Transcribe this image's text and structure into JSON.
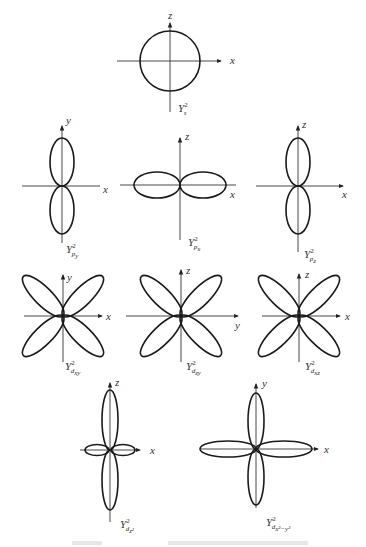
{
  "diagram": {
    "type": "angular-distribution-plots",
    "panels": [
      {
        "id": "s",
        "label_main": "Y",
        "label_sup": "2",
        "label_sub": "s",
        "axes": {
          "horizontal": "x",
          "vertical": "z"
        },
        "shape": "circle"
      },
      {
        "id": "py",
        "label_main": "Y",
        "label_sup": "2",
        "label_sub": "p",
        "label_subsub": "y",
        "axes": {
          "horizontal": "x",
          "vertical": "y"
        },
        "shape": "two-lobes-vertical"
      },
      {
        "id": "px",
        "label_main": "Y",
        "label_sup": "2",
        "label_sub": "p",
        "label_subsub": "x",
        "axes": {
          "horizontal": "x",
          "vertical": "z"
        },
        "shape": "two-lobes-horizontal"
      },
      {
        "id": "pz",
        "label_main": "Y",
        "label_sup": "2",
        "label_sub": "p",
        "label_subsub": "z",
        "axes": {
          "horizontal": "x",
          "vertical": "z"
        },
        "shape": "two-lobes-vertical"
      },
      {
        "id": "dxy",
        "label_main": "Y",
        "label_sup": "2",
        "label_sub": "d",
        "label_subsub": "xy",
        "axes": {
          "horizontal": "x",
          "vertical": "y"
        },
        "shape": "four-lobes-diagonal"
      },
      {
        "id": "dzy",
        "label_main": "Y",
        "label_sup": "2",
        "label_sub": "d",
        "label_subsub": "zy",
        "axes": {
          "horizontal": "y",
          "vertical": "z"
        },
        "shape": "four-lobes-diagonal"
      },
      {
        "id": "dxz",
        "label_main": "Y",
        "label_sup": "2",
        "label_sub": "d",
        "label_subsub": "xz",
        "axes": {
          "horizontal": "x",
          "vertical": "z"
        },
        "shape": "four-lobes-diagonal"
      },
      {
        "id": "dz2",
        "label_main": "Y",
        "label_sup": "2",
        "label_sub": "d",
        "label_subsub": "z²",
        "axes": {
          "horizontal": "x",
          "vertical": "z"
        },
        "shape": "two-long-lobes-vertical-plus-small-ring"
      },
      {
        "id": "dx2y2",
        "label_main": "Y",
        "label_sup": "2",
        "label_sub": "d",
        "label_subsub": "x²−y²",
        "axes": {
          "horizontal": "x",
          "vertical": "y"
        },
        "shape": "four-lobes-on-axes"
      }
    ]
  }
}
